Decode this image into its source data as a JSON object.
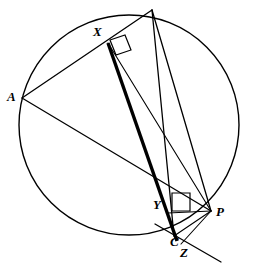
{
  "figure": {
    "background_color": "#ffffff",
    "stroke_color": "#000000",
    "width": 259,
    "height": 264
  },
  "circle": {
    "name": "circumcircle",
    "center_x": 129,
    "center_y": 125,
    "radius": 110,
    "stroke_width": 1.4
  },
  "labels": {
    "A": "A",
    "X": "X",
    "Y": "Y",
    "P": "P",
    "C": "C",
    "Z": "Z"
  },
  "points": {
    "B_apex": {
      "x": 152,
      "y": 10
    },
    "A": {
      "x": 22,
      "y": 98
    },
    "X": {
      "x": 108,
      "y": 43
    },
    "Y": {
      "x": 170,
      "y": 212
    },
    "P": {
      "x": 211,
      "y": 211
    },
    "C": {
      "x": 174,
      "y": 236
    },
    "Z": {
      "x": 180,
      "y": 243
    }
  },
  "label_positions": {
    "A": {
      "x": 7,
      "y": 90
    },
    "X": {
      "x": 93,
      "y": 25
    },
    "Y": {
      "x": 153,
      "y": 198
    },
    "P": {
      "x": 216,
      "y": 205
    },
    "C": {
      "x": 170,
      "y": 235
    },
    "Z": {
      "x": 180,
      "y": 246
    }
  },
  "segments": [
    {
      "name": "chord-apex-to-A",
      "x1": 152,
      "y1": 10,
      "x2": 22,
      "y2": 98,
      "width": 1.3
    },
    {
      "name": "chord-apex-to-C",
      "x1": 152,
      "y1": 10,
      "x2": 174,
      "y2": 236,
      "width": 1.3
    },
    {
      "name": "chord-A-to-P",
      "x1": 22,
      "y1": 98,
      "x2": 211,
      "y2": 211,
      "width": 1.3
    },
    {
      "name": "chord-apex-to-P",
      "x1": 152,
      "y1": 10,
      "x2": 211,
      "y2": 211,
      "width": 1.3
    },
    {
      "name": "segment-X-to-P",
      "x1": 108,
      "y1": 43,
      "x2": 211,
      "y2": 211,
      "width": 1.1
    },
    {
      "name": "segment-P-to-C",
      "x1": 211,
      "y1": 211,
      "x2": 174,
      "y2": 236,
      "width": 1.1
    },
    {
      "name": "segment-P-to-Z",
      "x1": 211,
      "y1": 211,
      "x2": 181,
      "y2": 244,
      "width": 1.1
    },
    {
      "name": "segment-P-to-Y",
      "x1": 211,
      "y1": 211,
      "x2": 168,
      "y2": 213,
      "width": 1.1
    },
    {
      "name": "simson-line-extended",
      "x1": 155,
      "y1": 224,
      "x2": 221,
      "y2": 262,
      "width": 1.3
    }
  ],
  "thick_segments": [
    {
      "name": "segment-X-to-C-thick",
      "x1": 108,
      "y1": 43,
      "x2": 177,
      "y2": 241,
      "width": 3.4
    }
  ],
  "right_angle_marks": [
    {
      "name": "right-angle-at-X",
      "points": "110,40 125,35 131,50 116,55",
      "width": 1.2
    },
    {
      "name": "right-angle-at-Y",
      "points": "172,193 190,193 190,211 172,211",
      "width": 1.2
    }
  ]
}
